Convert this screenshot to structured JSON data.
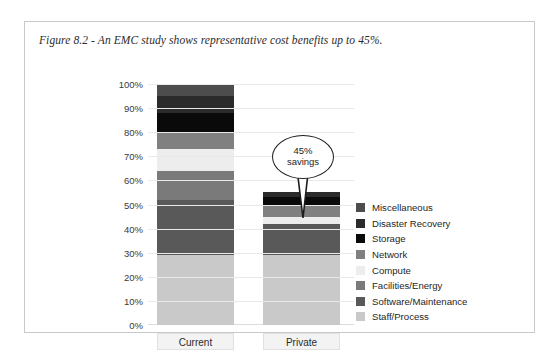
{
  "figure": {
    "caption": "Figure 8.2 - An EMC study shows representative cost benefits up to 45%."
  },
  "callout": {
    "line1": "45%",
    "line2": "savings"
  },
  "chart_data": {
    "type": "bar",
    "subtype": "stacked-column",
    "title": "Figure 8.2 - An EMC study shows representative cost benefits up to 45%.",
    "xlabel": "",
    "ylabel": "",
    "categories": [
      "Current",
      "Private"
    ],
    "ylim": [
      0,
      100
    ],
    "ytick_labels": [
      "0%",
      "10%",
      "20%",
      "30%",
      "40%",
      "50%",
      "60%",
      "70%",
      "80%",
      "90%",
      "100%"
    ],
    "ytick_values": [
      0,
      10,
      20,
      30,
      40,
      50,
      60,
      70,
      80,
      90,
      100
    ],
    "grid": true,
    "legend_position": "right",
    "stack_order_bottom_to_top": [
      "Staff/Process",
      "Software/Maintenance",
      "Facilities/Energy",
      "Compute",
      "Network",
      "Storage",
      "Disaster Recovery",
      "Miscellaneous"
    ],
    "series": [
      {
        "name": "Miscellaneous",
        "color": "#4d4d4d",
        "values": [
          5,
          0
        ]
      },
      {
        "name": "Disaster Recovery",
        "color": "#2b2b2b",
        "values": [
          7,
          2
        ]
      },
      {
        "name": "Storage",
        "color": "#0a0a0a",
        "values": [
          8,
          3
        ]
      },
      {
        "name": "Network",
        "color": "#808080",
        "values": [
          7,
          5
        ]
      },
      {
        "name": "Compute",
        "color": "#ededed",
        "values": [
          9,
          3
        ]
      },
      {
        "name": "Facilities/Energy",
        "color": "#7a7a7a",
        "values": [
          12,
          0
        ]
      },
      {
        "name": "Software/Maintenance",
        "color": "#595959",
        "values": [
          23,
          13
        ]
      },
      {
        "name": "Staff/Process",
        "color": "#c9c9c9",
        "values": [
          29,
          29
        ]
      }
    ],
    "totals": [
      100,
      55
    ],
    "annotations": [
      {
        "text": "45% savings",
        "points_to": "Private",
        "value": 45
      }
    ]
  },
  "y_axis": {
    "ticks": [
      {
        "label": "100%",
        "value": 100
      },
      {
        "label": "90%",
        "value": 90
      },
      {
        "label": "80%",
        "value": 80
      },
      {
        "label": "70%",
        "value": 70
      },
      {
        "label": "60%",
        "value": 60
      },
      {
        "label": "50%",
        "value": 50
      },
      {
        "label": "40%",
        "value": 40
      },
      {
        "label": "30%",
        "value": 30
      },
      {
        "label": "20%",
        "value": 20
      },
      {
        "label": "10%",
        "value": 10
      },
      {
        "label": "0%",
        "value": 0
      }
    ]
  },
  "x_axis": {
    "ticks": [
      {
        "label": "Current"
      },
      {
        "label": "Private"
      }
    ]
  },
  "legend": {
    "items": [
      {
        "label": "Miscellaneous",
        "color": "#4d4d4d"
      },
      {
        "label": "Disaster Recovery",
        "color": "#2b2b2b"
      },
      {
        "label": "Storage",
        "color": "#0a0a0a"
      },
      {
        "label": "Network",
        "color": "#808080"
      },
      {
        "label": "Compute",
        "color": "#ededed"
      },
      {
        "label": "Facilities/Energy",
        "color": "#7a7a7a"
      },
      {
        "label": "Software/Maintenance",
        "color": "#595959"
      },
      {
        "label": "Staff/Process",
        "color": "#c9c9c9"
      }
    ]
  }
}
